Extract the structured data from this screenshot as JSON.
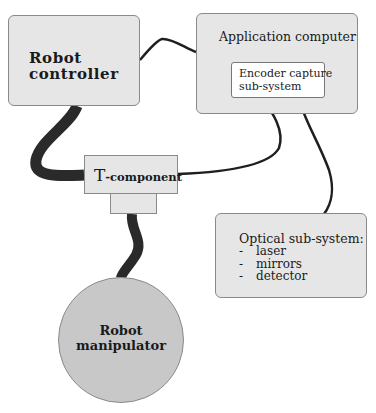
{
  "diagram": {
    "nodes": {
      "robot_controller": {
        "line1": "Robot",
        "line2": "controller",
        "shape": "rounded-rect"
      },
      "application_computer": {
        "label": "Application computer",
        "shape": "rounded-rect"
      },
      "encoder_capture": {
        "line1": "Encoder capture",
        "line2": "sub-system",
        "shape": "rect",
        "parent": "Application computer"
      },
      "t_component": {
        "label_big": "T",
        "label_small": "-component",
        "shape": "T-shape"
      },
      "optical_subsystem": {
        "title": "Optical sub-system:",
        "items": [
          {
            "dash": "-",
            "label": "laser"
          },
          {
            "dash": "-",
            "label": "mirrors"
          },
          {
            "dash": "-",
            "label": "detector"
          }
        ],
        "shape": "rounded-rect"
      },
      "robot_manipulator": {
        "line1": "Robot",
        "line2": "manipulator",
        "shape": "circle"
      }
    },
    "edges": [
      {
        "from": "Robot controller",
        "to": "Application computer",
        "style": "thin cable"
      },
      {
        "from": "Robot controller",
        "to": "T-component",
        "style": "thick cable"
      },
      {
        "from": "T-component",
        "to": "Robot manipulator",
        "style": "thick cable"
      },
      {
        "from": "T-component",
        "to": "Encoder capture sub-system",
        "style": "thin cable"
      },
      {
        "from": "Encoder capture sub-system",
        "to": "Optical sub-system",
        "style": "thin cable"
      }
    ],
    "colors": {
      "box_fill": "#e6e6e6",
      "circle_fill": "#c8c8c8",
      "cable": "#1f1f1f",
      "inner_box_fill": "#ffffff"
    }
  }
}
